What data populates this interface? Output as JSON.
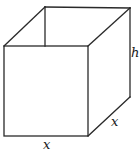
{
  "diagram": {
    "labels": {
      "height": "h",
      "base_width": "x",
      "base_depth": "x"
    },
    "colors": {
      "line": "#2a2a2a",
      "background": "#ffffff"
    }
  }
}
